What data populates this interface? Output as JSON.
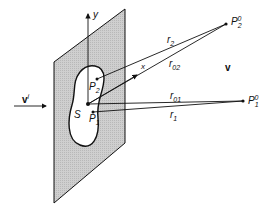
{
  "diagram": {
    "labels": {
      "incident_wave": "v",
      "incident_sup": "i",
      "field": "v",
      "aperture": "S",
      "p1": "P",
      "p1_sub": "1",
      "p2": "P",
      "p2_sub": "2",
      "p1_far": "P",
      "p1_far_sub": "1",
      "p1_far_sup": "0",
      "p2_far": "P",
      "p2_far_sub": "2",
      "p2_far_sup": "0",
      "r1": "r",
      "r1_sub": "1",
      "r2": "r",
      "r2_sub": "2",
      "r01": "r",
      "r01_sub": "01",
      "r02": "r",
      "r02_sub": "02",
      "x_axis": "x",
      "y_axis": "y"
    },
    "colors": {
      "plate_fill": "#c8c8c8",
      "line": "#111111",
      "background": "#ffffff"
    }
  }
}
